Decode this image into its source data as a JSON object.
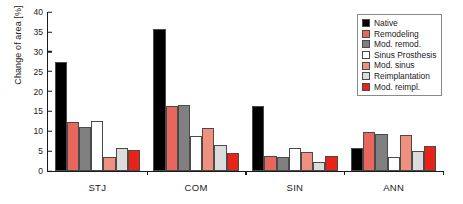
{
  "chart_data": {
    "type": "bar",
    "title": "",
    "xlabel": "",
    "ylabel": "Change of area [%]",
    "ylim": [
      0,
      40
    ],
    "yticks": [
      0,
      5,
      10,
      15,
      20,
      25,
      30,
      35,
      40
    ],
    "grid": false,
    "legend_position": "top-right",
    "categories": [
      "STJ",
      "COM",
      "SIN",
      "ANN"
    ],
    "series": [
      {
        "name": "Native",
        "color": "#000000",
        "values": [
          27.5,
          35.7,
          16.4,
          5.7
        ]
      },
      {
        "name": "Remodeling",
        "color": "#E8675C",
        "values": [
          12.3,
          16.4,
          3.8,
          9.9
        ]
      },
      {
        "name": "Mod. remod.",
        "color": "#808080",
        "values": [
          11.1,
          16.7,
          3.5,
          9.3
        ]
      },
      {
        "name": "Sinus Prosthesis",
        "color": "#FFFFFF",
        "values": [
          12.6,
          8.7,
          5.7,
          3.6
        ]
      },
      {
        "name": "Mod. sinus",
        "color": "#F0907F",
        "values": [
          3.5,
          10.9,
          4.8,
          9.1
        ]
      },
      {
        "name": "Reimplantation",
        "color": "#DCDCDC",
        "values": [
          5.8,
          6.5,
          2.3,
          5.0
        ]
      },
      {
        "name": "Mod. reimpl.",
        "color": "#E82318",
        "values": [
          5.2,
          4.5,
          3.8,
          6.3
        ]
      }
    ]
  },
  "legend": {
    "entries": [
      {
        "label": "Native"
      },
      {
        "label": "Remodeling"
      },
      {
        "label": "Mod. remod."
      },
      {
        "label": "Sinus Prosthesis"
      },
      {
        "label": "Mod. sinus"
      },
      {
        "label": "Reimplantation"
      },
      {
        "label": "Mod. reimpl."
      }
    ]
  }
}
